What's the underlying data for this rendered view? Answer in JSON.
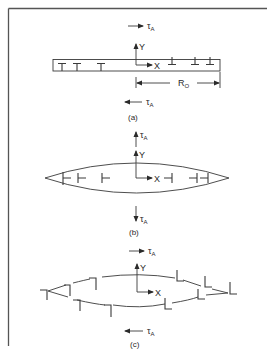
{
  "figure": {
    "colors": {
      "line": "#3a3a3a",
      "frame": "#555555",
      "background": "#ffffff"
    },
    "panels": [
      {
        "id": "a",
        "caption": "(a)",
        "stress_top": {
          "symbol": "τ",
          "subscript": "A",
          "direction": "right"
        },
        "stress_bottom": {
          "symbol": "τ",
          "subscript": "A",
          "direction": "left"
        },
        "axis_y": "Y",
        "axis_x": "X",
        "shape": "rectangle",
        "dimension_label": {
          "symbol": "R",
          "subscript": "O"
        },
        "dislocations_left": [
          "⊤",
          "⊤",
          "⊤"
        ],
        "dislocations_right": [
          "⊥",
          "⊥",
          "⊥"
        ]
      },
      {
        "id": "b",
        "caption": "(b)",
        "stress_top": {
          "symbol": "τ",
          "subscript": "A",
          "direction": "up"
        },
        "stress_bottom": {
          "symbol": "τ",
          "subscript": "A",
          "direction": "down"
        },
        "axis_y": "Y",
        "axis_x": "X",
        "shape": "lens",
        "dislocations_left": [
          "⊢",
          "⊢",
          "⊢"
        ],
        "dislocations_right": [
          "⊣",
          "⊣",
          "⊣"
        ]
      },
      {
        "id": "c",
        "caption": "(c)",
        "stress_top": {
          "symbol": "τ",
          "subscript": "A",
          "direction": "right"
        },
        "stress_bottom": {
          "symbol": "τ",
          "subscript": "A",
          "direction": "left"
        },
        "axis_y": "Y",
        "axis_x": "X",
        "shape": "broken-lens",
        "dislocations_left": [
          "⌉",
          "⌉",
          "⌉",
          "⌉",
          "⌉"
        ],
        "dislocations_right": [
          "L",
          "L",
          "L",
          "L",
          "L"
        ]
      }
    ]
  }
}
